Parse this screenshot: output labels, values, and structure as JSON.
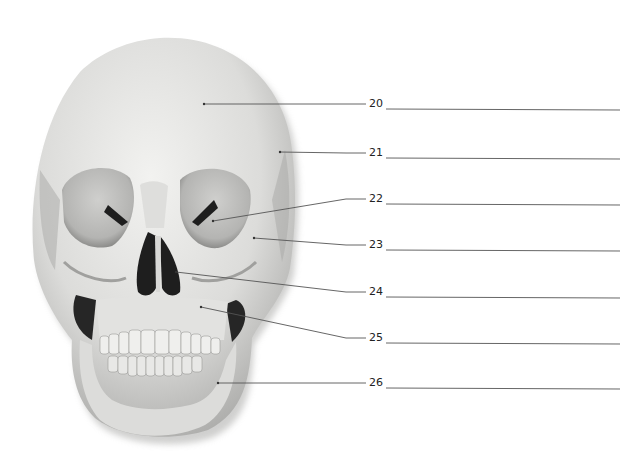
{
  "diagram": {
    "colors": {
      "bone": "#e6e6e4",
      "shadow": "#8a8a88",
      "cavity": "#1e1e1e",
      "line": "#555555",
      "text": "#222222"
    },
    "labels": [
      {
        "number": "20",
        "answer": "",
        "target_x": 204,
        "target_y": 104,
        "label_y": 104
      },
      {
        "number": "21",
        "answer": "",
        "target_x": 280,
        "target_y": 152,
        "label_y": 153
      },
      {
        "number": "22",
        "answer": "",
        "target_x": 213,
        "target_y": 221,
        "label_y": 199
      },
      {
        "number": "23",
        "answer": "",
        "target_x": 254,
        "target_y": 238,
        "label_y": 245
      },
      {
        "number": "24",
        "answer": "",
        "target_x": 176,
        "target_y": 272,
        "label_y": 292
      },
      {
        "number": "25",
        "answer": "",
        "target_x": 201,
        "target_y": 307,
        "label_y": 338
      },
      {
        "number": "26",
        "answer": "",
        "target_x": 218,
        "target_y": 383,
        "label_y": 383
      }
    ]
  }
}
